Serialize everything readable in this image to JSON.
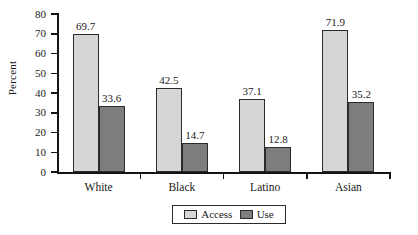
{
  "chart_data": {
    "type": "bar",
    "title": "",
    "xlabel": "",
    "ylabel": "Percent",
    "ylim": [
      0,
      80
    ],
    "yticks": [
      0,
      10,
      20,
      30,
      40,
      50,
      60,
      70,
      80
    ],
    "ytick_labels": [
      "0",
      "10",
      "20",
      "30",
      "40",
      "50",
      "60",
      "70",
      "80"
    ],
    "grid": false,
    "legend_position": "bottom-center",
    "categories": [
      "White",
      "Black",
      "Latino",
      "Asian"
    ],
    "series": [
      {
        "name": "Access",
        "color": "#d6d6d6",
        "values": [
          69.7,
          42.5,
          37.1,
          71.9
        ],
        "labels": [
          "69.7",
          "42.5",
          "37.1",
          "71.9"
        ]
      },
      {
        "name": "Use",
        "color": "#7d7d7d",
        "values": [
          33.6,
          14.7,
          12.8,
          35.2
        ],
        "labels": [
          "33.6",
          "14.7",
          "12.8",
          "35.2"
        ]
      }
    ]
  },
  "legend": {
    "entries": [
      {
        "label": "Access",
        "swatch": "legend-swatch-access"
      },
      {
        "label": "Use",
        "swatch": "legend-swatch-use"
      }
    ]
  },
  "axes": {
    "y_title": "Percent"
  }
}
